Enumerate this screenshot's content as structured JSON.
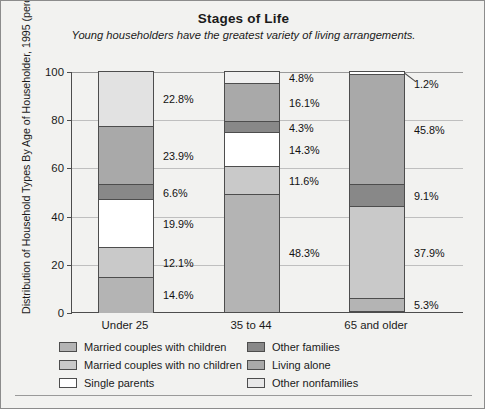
{
  "chart_data": {
    "type": "bar",
    "subtype": "stacked-bar-100",
    "title": "Stages of Life",
    "subtitle": "Young householders have the greatest variety of living arrangements.",
    "xlabel": "",
    "ylabel": "Distribution of Household Types By Age of Householder, 1995 (percent)",
    "ylim": [
      0,
      100
    ],
    "yticks": [
      0,
      20,
      40,
      60,
      80,
      100
    ],
    "ytick_labels": [
      "0",
      "20",
      "40",
      "60",
      "80",
      "100"
    ],
    "grid": true,
    "legend_position": "bottom",
    "categories": [
      "Under 25",
      "35 to 44",
      "65 and older"
    ],
    "series": [
      {
        "name": "Married couples with children",
        "color": "#b4b4b4",
        "values": [
          14.6,
          48.3,
          5.3
        ]
      },
      {
        "name": "Married couples with no children",
        "color": "#c9c9c9",
        "values": [
          12.1,
          11.6,
          37.9
        ]
      },
      {
        "name": "Single parents",
        "color": "#ffffff",
        "values": [
          19.9,
          14.3,
          0.0
        ]
      },
      {
        "name": "Other families",
        "color": "#888888",
        "values": [
          6.6,
          4.3,
          9.1
        ]
      },
      {
        "name": "Living alone",
        "color": "#a9a9a9",
        "values": [
          23.9,
          16.1,
          45.8
        ]
      },
      {
        "name": "Other nonfamilies",
        "color": "#e2e2e2",
        "values": [
          22.8,
          4.8,
          1.2
        ]
      }
    ],
    "bars": [
      {
        "category": "Under 25",
        "segments": [
          {
            "series": "Other nonfamilies",
            "value": 22.8,
            "label": "22.8%",
            "color": "#e2e2e2"
          },
          {
            "series": "Living alone",
            "value": 23.9,
            "label": "23.9%",
            "color": "#a9a9a9"
          },
          {
            "series": "Other families",
            "value": 6.6,
            "label": "6.6%",
            "color": "#888888"
          },
          {
            "series": "Single parents",
            "value": 19.9,
            "label": "19.9%",
            "color": "#ffffff"
          },
          {
            "series": "Married couples with no children",
            "value": 12.1,
            "label": "12.1%",
            "color": "#c9c9c9"
          },
          {
            "series": "Married couples with children",
            "value": 14.6,
            "label": "14.6%",
            "color": "#b4b4b4"
          }
        ]
      },
      {
        "category": "35 to 44",
        "segments": [
          {
            "series": "Other nonfamilies",
            "value": 4.8,
            "label": "4.8%",
            "color": "#f0f0f0"
          },
          {
            "series": "Living alone",
            "value": 16.1,
            "label": "16.1%",
            "color": "#a9a9a9"
          },
          {
            "series": "Other families",
            "value": 4.3,
            "label": "4.3%",
            "color": "#888888"
          },
          {
            "series": "Single parents",
            "value": 14.3,
            "label": "14.3%",
            "color": "#ffffff"
          },
          {
            "series": "Married couples with no children",
            "value": 11.6,
            "label": "11.6%",
            "color": "#c9c9c9"
          },
          {
            "series": "Married couples with children",
            "value": 48.3,
            "label": "48.3%",
            "color": "#b4b4b4"
          }
        ]
      },
      {
        "category": "65 and older",
        "segments": [
          {
            "series": "Other nonfamilies",
            "value": 1.2,
            "label": "1.2%",
            "color": "#ffffff"
          },
          {
            "series": "Living alone",
            "value": 45.8,
            "label": "45.8%",
            "color": "#a9a9a9"
          },
          {
            "series": "Other families",
            "value": 9.1,
            "label": "9.1%",
            "color": "#888888"
          },
          {
            "series": "Married couples with no children",
            "value": 37.9,
            "label": "37.9%",
            "color": "#c9c9c9"
          },
          {
            "series": "Married couples with children",
            "value": 5.3,
            "label": "5.3%",
            "color": "#b4b4b4"
          }
        ]
      }
    ]
  },
  "legend": {
    "column_left": [
      {
        "label": "Married couples with children",
        "color": "#b4b4b4"
      },
      {
        "label": "Married couples with no children",
        "color": "#c9c9c9"
      },
      {
        "label": "Single parents",
        "color": "#ffffff"
      }
    ],
    "column_right": [
      {
        "label": "Other families",
        "color": "#888888"
      },
      {
        "label": "Living alone",
        "color": "#a9a9a9"
      },
      {
        "label": "Other nonfamilies",
        "color": "#e8e8e8"
      }
    ]
  },
  "colors": {
    "background": "#f2f2f0",
    "frame": "#8c8c8c",
    "axis": "#4d4d4d",
    "grid": "#bfbfbf",
    "text": "#1a1a1a"
  }
}
